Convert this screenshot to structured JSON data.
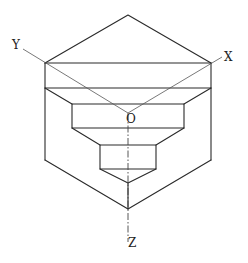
{
  "diagram": {
    "title": "",
    "type": "isometric stepped solid with axes",
    "labels": {
      "y_axis": "Y",
      "x_axis": "X",
      "origin": "O",
      "z_axis": "Z"
    },
    "colors": {
      "line": "#2a2a2a",
      "background": "#ffffff"
    }
  }
}
